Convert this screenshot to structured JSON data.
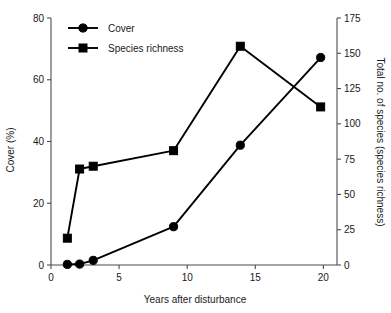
{
  "chart_data": {
    "type": "line",
    "title": "",
    "xlabel": "Years after disturbance",
    "ylabel": "Cover (%)",
    "y2label": "Total no. of species (species richness)",
    "xlim": [
      0,
      21
    ],
    "ylim": [
      0,
      80
    ],
    "y2lim": [
      0,
      175
    ],
    "xticks": [
      "0",
      "5",
      "10",
      "15",
      "20"
    ],
    "xtick_values": [
      0,
      5,
      10,
      15,
      20
    ],
    "yticks": [
      "0",
      "20",
      "40",
      "60",
      "80"
    ],
    "ytick_values": [
      0,
      20,
      40,
      60,
      80
    ],
    "y2ticks": [
      "0",
      "25",
      "50",
      "75",
      "100",
      "125",
      "150",
      "175"
    ],
    "y2tick_values": [
      0,
      25,
      50,
      75,
      100,
      125,
      150,
      175
    ],
    "grid": false,
    "legend_position": "top-left",
    "series": [
      {
        "name": "Cover",
        "axis": "left",
        "marker": "circle",
        "units": "%",
        "x": [
          1.2,
          2.1,
          3.1,
          9.0,
          13.9,
          19.8
        ],
        "values": [
          0.2,
          0.3,
          1.5,
          12.4,
          38.8,
          67.2
        ]
      },
      {
        "name": "Species richness",
        "axis": "right",
        "marker": "square",
        "units": "species",
        "x": [
          1.2,
          2.1,
          3.1,
          9.0,
          13.9,
          19.8
        ],
        "values": [
          19,
          68,
          70,
          81,
          155,
          112
        ]
      }
    ],
    "colors": {
      "series": "#000000",
      "axis": "#4d4d4d",
      "text": "#1a1a1a",
      "background": "#ffffff"
    }
  },
  "legend": {
    "items": [
      {
        "label": "Cover",
        "marker": "circle-marker"
      },
      {
        "label": "Species richness",
        "marker": "square-marker"
      }
    ]
  },
  "axes": {
    "x_title": "Years after disturbance",
    "y_left_title": "Cover (%)",
    "y_right_title": "Total no. of species (species richness)"
  }
}
